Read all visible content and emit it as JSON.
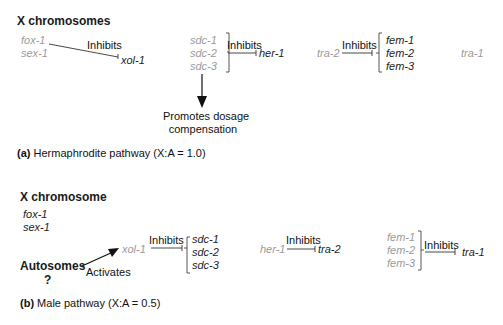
{
  "panel_a": {
    "header": "X chromosomes",
    "genes_x": [
      "fox-1",
      "sex-1"
    ],
    "xol": "xol-1",
    "inhibits_1": "Inhibits",
    "sdc": [
      "sdc-1",
      "sdc-2",
      "sdc-3"
    ],
    "inhibits_2": "Inhibits",
    "her": "her-1",
    "tra2": "tra-2",
    "inhibits_3": "Inhibits",
    "fem": [
      "fem-1",
      "fem-2",
      "fem-3"
    ],
    "tra1": "tra-1",
    "promotes_line1": "Promotes dosage",
    "promotes_line2": "compensation",
    "caption_label": "(a)",
    "caption_text": " Hermaphrodite pathway (X:A = 1.0)"
  },
  "panel_b": {
    "header": "X chromosome",
    "genes_x": [
      "fox-1",
      "sex-1"
    ],
    "autosomes": "Autosomes",
    "question": "?",
    "activates": "Activates",
    "xol": "xol-1",
    "inhibits_1": "Inhibits",
    "sdc": [
      "sdc-1",
      "sdc-2",
      "sdc-3"
    ],
    "her": "her-1",
    "inhibits_2": "Inhibits",
    "tra2": "tra-2",
    "fem": [
      "fem-1",
      "fem-2",
      "fem-3"
    ],
    "inhibits_3": "Inhibits",
    "tra1": "tra-1",
    "caption_label": "(b)",
    "caption_text": " Male pathway (X:A = 0.5)"
  },
  "colors": {
    "active": "#222222",
    "inactive": "#9a9a9a"
  }
}
